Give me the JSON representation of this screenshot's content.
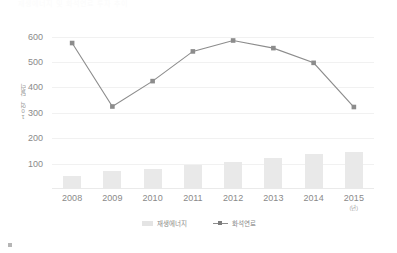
{
  "chart_data": {
    "type": "bar",
    "title": "",
    "subtitle": "",
    "xlabel": "(년)",
    "ylabel": "10억 달러",
    "categories": [
      "2008",
      "2009",
      "2010",
      "2011",
      "2012",
      "2013",
      "2014",
      "2015"
    ],
    "ylim": [
      0,
      650
    ],
    "yticks": [
      100,
      200,
      300,
      400,
      500,
      600
    ],
    "ytick_labels": [
      "100",
      "200",
      "300",
      "400",
      "500",
      "600"
    ],
    "grid": true,
    "legend_position": "bottom",
    "series": [
      {
        "name": "재생에너지",
        "type": "bar",
        "color": "#e9e9e9",
        "values": [
          50,
          72,
          77,
          93,
          105,
          122,
          137,
          147
        ]
      },
      {
        "name": "화석연료",
        "type": "line",
        "color": "#8c8c8c",
        "marker": "square",
        "values": [
          575,
          325,
          425,
          542,
          585,
          555,
          497,
          323
        ]
      }
    ]
  },
  "axes": {
    "y_axis_label": "10억 달러",
    "x_axis_unit": "(년)"
  },
  "legend": {
    "items": [
      {
        "label": "재생에너지",
        "swatch": "bar-swatch",
        "color": "#e4e4e4"
      },
      {
        "label": "화석연료",
        "swatch": "line-marker-swatch",
        "color": "#8c8c8c"
      }
    ]
  },
  "top_strip": {
    "text": "재생에너지 및 화석연료 투자 추이"
  },
  "colors": {
    "bar": "#e9e9e9",
    "line": "#8c8c8c",
    "marker": "#7d7d7d",
    "gridline": "#f1f1f1",
    "tick_text": "#8a8a8a",
    "background": "#ffffff"
  }
}
